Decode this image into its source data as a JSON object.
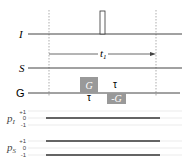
{
  "channels": {
    "I": {
      "label": "I"
    },
    "S": {
      "label": "S"
    },
    "G": {
      "label": "G"
    }
  },
  "delay": {
    "label": "t",
    "sub": "1"
  },
  "gradients": [
    {
      "label": "G",
      "color": "#999999"
    },
    {
      "label": "-G",
      "color": "#999999"
    }
  ],
  "tau": {
    "above": "τ",
    "below": "τ"
  },
  "coherence": [
    {
      "label": "p",
      "sub": "I",
      "levels": [
        "+1",
        "0",
        "-1"
      ],
      "paths": [
        "0"
      ]
    },
    {
      "label": "p",
      "sub": "S",
      "levels": [
        "+1",
        "0",
        "-1"
      ],
      "paths": [
        "+1",
        "-1"
      ]
    }
  ]
}
